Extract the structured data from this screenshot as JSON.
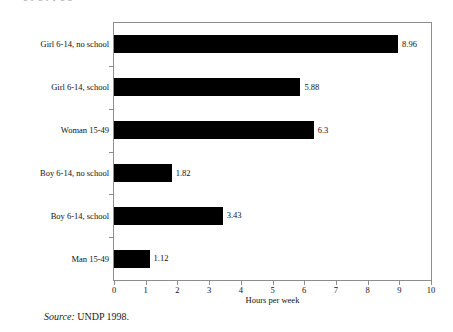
{
  "figure": {
    "truncated_title": "g p g p y g g",
    "source_label": "Source:",
    "source_text": "UNDP 1998."
  },
  "chart_data": {
    "type": "bar",
    "orientation": "horizontal",
    "title": "",
    "xlabel": "Hours per week",
    "ylabel": "",
    "xlim": [
      0,
      10
    ],
    "xticks": [
      0,
      1,
      2,
      3,
      4,
      5,
      6,
      7,
      8,
      9,
      10
    ],
    "xtick_labels": [
      "0",
      "1",
      "2",
      "3",
      "4",
      "5",
      "6",
      "7",
      "8",
      "9",
      "10"
    ],
    "grid": false,
    "legend": false,
    "bar_color": "#000000",
    "categories": [
      "Girl 6-14, no school",
      "Girl 6-14, school",
      "Woman 15-49",
      "Boy 6-14, no school",
      "Boy 6-14, school",
      "Man 15-49"
    ],
    "values": [
      8.96,
      5.88,
      6.3,
      1.82,
      3.43,
      1.12
    ],
    "value_labels": [
      "8.96",
      "5.88",
      "6.3",
      "1.82",
      "3.43",
      "1.12"
    ]
  }
}
